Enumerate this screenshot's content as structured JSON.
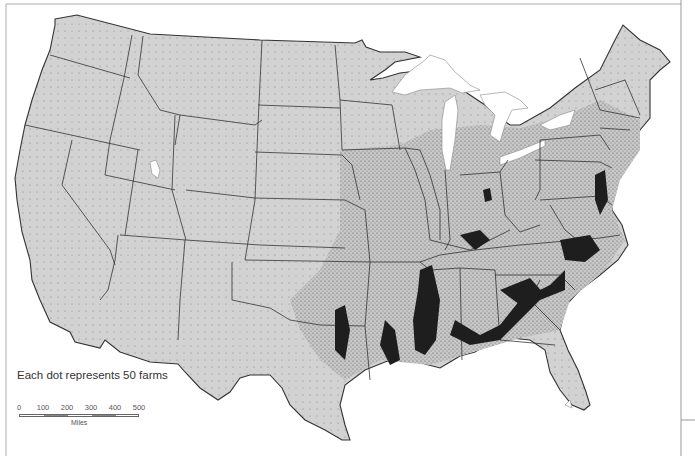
{
  "map": {
    "title": "Farms per county (dot density), conterminous United States",
    "legend": {
      "text": "Each dot represents 50 farms"
    },
    "scale_bar": {
      "ticks": [
        "0",
        "100",
        "200",
        "300",
        "400",
        "500"
      ],
      "units": "Miles"
    },
    "colors": {
      "land": "#d2d2d2",
      "water": "#ffffff",
      "border": "#333333",
      "dense": "#1e1e1e",
      "frame": "#999999"
    },
    "regions_high_density": [
      "Mississippi Delta",
      "Alabama-Georgia Black Belt",
      "Carolina Piedmont",
      "Kentucky-Tennessee",
      "Central Texas",
      "Chesapeake / Delmarva"
    ]
  }
}
